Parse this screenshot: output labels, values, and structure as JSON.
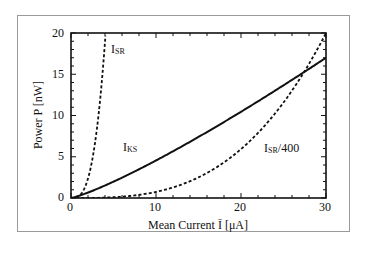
{
  "chart_data": {
    "type": "line",
    "title": "",
    "xlabel": "Mean Current Ī [μA]",
    "ylabel": "Power P [nW]",
    "xlim": [
      0,
      30
    ],
    "ylim": [
      0,
      20
    ],
    "xticks": [
      0,
      10,
      20,
      30
    ],
    "yticks": [
      0,
      5,
      10,
      15,
      20
    ],
    "x_minor_step": 2,
    "y_minor_step": 1,
    "grid": false,
    "legend": "inline labels",
    "series": [
      {
        "name": "I_SR",
        "style": "dashed",
        "x": [
          0,
          0.5,
          1,
          1.5,
          2,
          2.5,
          3,
          3.5,
          4.05
        ],
        "y": [
          0,
          0.04,
          0.3,
          1.0,
          2.4,
          4.6,
          8.0,
          12.7,
          20
        ]
      },
      {
        "name": "I_KS",
        "style": "solid",
        "x": [
          0,
          5,
          10,
          15,
          20,
          25,
          30
        ],
        "y": [
          0,
          1.9,
          4.5,
          7.4,
          10.4,
          13.6,
          17.0
        ]
      },
      {
        "name": "I_SR/400",
        "style": "dashed",
        "x": [
          0,
          5,
          10,
          15,
          20,
          25,
          28,
          30
        ],
        "y": [
          0,
          0.1,
          0.7,
          2.4,
          5.8,
          11.4,
          16.1,
          20
        ]
      }
    ],
    "annotations": [
      {
        "text": "I_SR",
        "x": 5.3,
        "y": 18
      },
      {
        "text": "I_KS",
        "x": 6.3,
        "y": 6.5
      },
      {
        "text": "I_SR/400",
        "x": 20.5,
        "y": 6.3
      }
    ]
  },
  "labels": {
    "xlabel": "Mean Current Ī [μA]",
    "ylabel": "Power P [nW]",
    "x_ticks": [
      "0",
      "10",
      "20",
      "30"
    ],
    "y_ticks": [
      "0",
      "5",
      "10",
      "15",
      "20"
    ],
    "isr_main": "I",
    "isr_sub": "SR",
    "iks_main": "I",
    "iks_sub": "KS",
    "isr400_main": "I",
    "isr400_sub": "SR",
    "isr400_suffix": "/400"
  }
}
